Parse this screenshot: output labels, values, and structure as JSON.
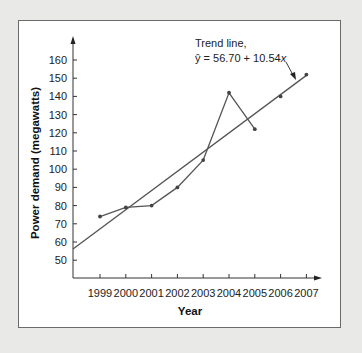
{
  "chart_data": {
    "type": "line",
    "title": "",
    "xlabel": "Year",
    "ylabel": "Power demand (megawatts)",
    "categories": [
      "1999",
      "2000",
      "2001",
      "2002",
      "2003",
      "2004",
      "2005",
      "2006",
      "2007"
    ],
    "series": [
      {
        "name": "Power demand",
        "values": [
          74,
          79,
          80,
          90,
          105,
          142,
          122,
          140,
          152
        ]
      },
      {
        "name": "Trend line",
        "values": [
          67.24,
          77.78,
          88.32,
          98.86,
          109.4,
          119.94,
          130.48,
          141.02,
          151.56
        ]
      }
    ],
    "y_ticks": [
      50,
      60,
      70,
      80,
      90,
      100,
      110,
      120,
      130,
      140,
      150,
      160
    ],
    "ylim": [
      43,
      172
    ],
    "grid": false,
    "legend": "none",
    "annotations": [
      {
        "text_line1": "Trend line,",
        "text_line2": "ŷ = 56.70 + 10.54x",
        "points_to": "Trend line near 2007"
      }
    ],
    "trend_equation": {
      "intercept": 56.7,
      "slope": 10.54
    }
  },
  "labels": {
    "xlabel": "Year",
    "ylabel": "Power demand (megawatts)",
    "annot_line1": "Trend line,",
    "annot_line2_prefix": "ŷ = 56.70 + 10.54",
    "annot_line2_var": "x"
  }
}
